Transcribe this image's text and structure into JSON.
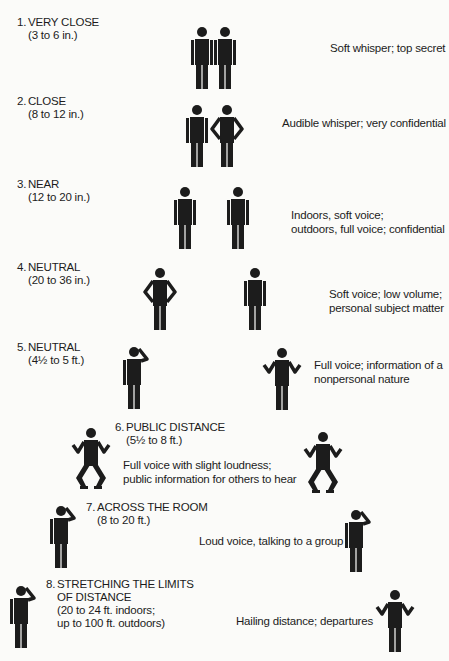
{
  "diagram": {
    "ink_color": "#1c1c1c",
    "background_color": "#fbfbf9",
    "items": [
      {
        "number": "1.",
        "name": "VERY CLOSE",
        "range": [
          "(3 to 6 in.)"
        ],
        "description": [
          "Soft whisper; top secret"
        ],
        "figures": [
          "standing",
          "standing"
        ]
      },
      {
        "number": "2.",
        "name": "CLOSE",
        "range": [
          "(8 to 12 in.)"
        ],
        "description": [
          "Audible whisper; very confidential"
        ],
        "figures": [
          "standing",
          "hands-on-hips"
        ]
      },
      {
        "number": "3.",
        "name": "NEAR",
        "range": [
          "(12 to 20 in.)"
        ],
        "description": [
          "Indoors, soft voice;",
          "outdoors, full voice; confidential"
        ],
        "figures": [
          "standing",
          "standing"
        ]
      },
      {
        "number": "4.",
        "name": "NEUTRAL",
        "range": [
          "(20 to 36 in.)"
        ],
        "description": [
          "Soft voice; low volume;",
          "personal subject matter"
        ],
        "figures": [
          "hands-on-hips",
          "standing"
        ]
      },
      {
        "number": "5.",
        "name": "NEUTRAL",
        "range": [
          "(4½ to 5 ft.)"
        ],
        "description": [
          "Full voice; information of a",
          "nonpersonal nature"
        ],
        "figures": [
          "hand-to-head",
          "shrugging"
        ]
      },
      {
        "number": "6.",
        "name": "PUBLIC DISTANCE",
        "range": [
          "(5½ to 8 ft.)"
        ],
        "description": [
          "Full voice with slight loudness;",
          "public information for others to hear"
        ],
        "figures": [
          "crouching-shrug",
          "crouching-shrug"
        ]
      },
      {
        "number": "7.",
        "name": "ACROSS THE ROOM",
        "range": [
          "(8 to 20 ft.)"
        ],
        "description": [
          "Loud voice, talking to a group"
        ],
        "figures": [
          "hand-to-head",
          "hand-to-head"
        ]
      },
      {
        "number": "8.",
        "name": "STRETCHING THE LIMITS",
        "name_line2": "OF DISTANCE",
        "range": [
          "(20 to 24 ft. indoors;",
          "up to 100 ft. outdoors)"
        ],
        "description": [
          "Hailing distance; departures"
        ],
        "figures": [
          "hand-to-head",
          "shrugging"
        ]
      }
    ]
  }
}
